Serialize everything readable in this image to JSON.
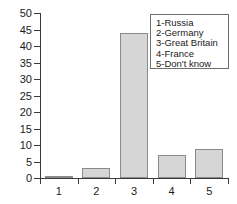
{
  "chart_data": {
    "type": "bar",
    "title": "",
    "xlabel": "",
    "ylabel": "",
    "categories": [
      "1",
      "2",
      "3",
      "4",
      "5"
    ],
    "values": [
      0.7,
      3,
      44,
      7,
      8.7
    ],
    "ylim": [
      0,
      50
    ],
    "ytick_values": [
      0,
      5,
      10,
      15,
      20,
      25,
      30,
      35,
      40,
      45,
      50
    ],
    "ytick_labels": [
      "0",
      "5",
      "10",
      "15",
      "20",
      "25",
      "30",
      "35",
      "40",
      "45",
      "50"
    ],
    "grid": false,
    "legend_position": "upper-right",
    "legend_entries": [
      "1-Russia",
      "2-Germany",
      "3-Great Britain",
      "4-France",
      "5-Don't know"
    ],
    "colors": {
      "bar_fill": "#d6d6d6",
      "bar_border": "#8a8a8a",
      "axis": "#3a3a3a",
      "text": "#1a1a1a",
      "background": "#ffffff",
      "legend_border": "#6e6e6e"
    }
  }
}
